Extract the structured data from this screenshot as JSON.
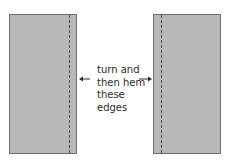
{
  "diagram": {
    "panels": [
      {
        "id": "left-panel",
        "hem_side": "right"
      },
      {
        "id": "right-panel",
        "hem_side": "left"
      }
    ],
    "label_lines": [
      "turn and",
      "then hem",
      "these",
      "edges"
    ],
    "colors": {
      "panel_fill": "#b9b9b9",
      "panel_border": "#6e6e6e",
      "hem_line": "#4a4a4a",
      "text": "#2a2a2a"
    }
  }
}
